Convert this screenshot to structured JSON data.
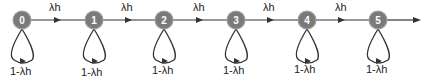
{
  "diagram": {
    "type": "markov-chain",
    "colors": {
      "node_fill": "#7a7a7a",
      "node_stroke": "#9a9a9a",
      "node_text": "#ffffff",
      "edge": "#333333",
      "text": "#222222"
    },
    "nodes": [
      {
        "id": "0",
        "label": "0",
        "loop_label": "1-λh"
      },
      {
        "id": "1",
        "label": "1",
        "loop_label": "1-λh"
      },
      {
        "id": "2",
        "label": "2",
        "loop_label": "1-λh"
      },
      {
        "id": "3",
        "label": "3",
        "loop_label": "1-λh"
      },
      {
        "id": "4",
        "label": "4",
        "loop_label": "1-λh"
      },
      {
        "id": "5",
        "label": "5",
        "loop_label": "1-λh"
      }
    ],
    "edges": [
      {
        "from": "0",
        "to": "1",
        "label": "λh"
      },
      {
        "from": "1",
        "to": "2",
        "label": "λh"
      },
      {
        "from": "2",
        "to": "3",
        "label": "λh"
      },
      {
        "from": "3",
        "to": "4",
        "label": "λh"
      },
      {
        "from": "4",
        "to": "5",
        "label": "λh"
      },
      {
        "from": "5",
        "to": "next",
        "label": ""
      }
    ]
  }
}
